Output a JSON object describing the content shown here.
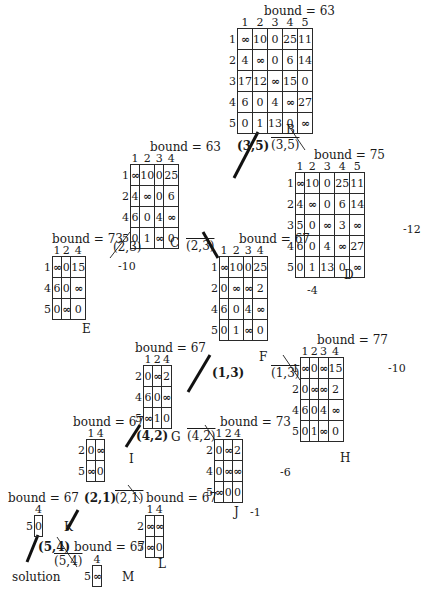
{
  "inf_symbol": "∞",
  "nodes": {
    "B": {
      "label": "B",
      "bound": "bound = 63",
      "cols": [
        "1",
        "2",
        "3",
        "4",
        "5"
      ],
      "rows": [
        "1",
        "2",
        "3",
        "4",
        "5"
      ],
      "cells": [
        [
          "∞",
          "10",
          "0",
          "25",
          "11"
        ],
        [
          "4",
          "∞",
          "0",
          "6",
          "14"
        ],
        [
          "17",
          "12",
          "∞",
          "15",
          "0"
        ],
        [
          "6",
          "0",
          "4",
          "∞",
          "27"
        ],
        [
          "0",
          "1",
          "13",
          "0",
          "∞"
        ]
      ],
      "reduction": ""
    },
    "C": {
      "label": "C",
      "bound": "bound = 63",
      "cols": [
        "1",
        "2",
        "3",
        "4"
      ],
      "rows": [
        "1",
        "2",
        "4",
        "5"
      ],
      "cells": [
        [
          "∞",
          "10",
          "0",
          "25"
        ],
        [
          "4",
          "∞",
          "0",
          "6"
        ],
        [
          "6",
          "0",
          "4",
          "∞"
        ],
        [
          "0",
          "1",
          "∞",
          "0"
        ]
      ],
      "reduction": ""
    },
    "D": {
      "label": "D",
      "bound": "bound = 75",
      "cols": [
        "1",
        "2",
        "3",
        "4",
        "5"
      ],
      "rows": [
        "1",
        "2",
        "3",
        "4",
        "5"
      ],
      "cells": [
        [
          "∞",
          "10",
          "0",
          "25",
          "11"
        ],
        [
          "4",
          "∞",
          "0",
          "6",
          "14"
        ],
        [
          "5",
          "0",
          "∞",
          "3",
          "∞"
        ],
        [
          "6",
          "0",
          "4",
          "∞",
          "27"
        ],
        [
          "0",
          "1",
          "13",
          "0",
          "∞"
        ]
      ],
      "reduction": "-12"
    },
    "E": {
      "label": "E",
      "bound": "bound = 73",
      "cols": [
        "1",
        "2",
        "4"
      ],
      "rows": [
        "1",
        "4",
        "5"
      ],
      "cells": [
        [
          "∞",
          "0",
          "15"
        ],
        [
          "6",
          "0",
          "∞"
        ],
        [
          "0",
          "∞",
          "0"
        ]
      ],
      "reduction": "-10"
    },
    "F": {
      "label": "F",
      "bound": "bound = 67",
      "cols": [
        "1",
        "2",
        "3",
        "4"
      ],
      "rows": [
        "1",
        "2",
        "4",
        "5"
      ],
      "cells": [
        [
          "∞",
          "10",
          "0",
          "25"
        ],
        [
          "0",
          "∞",
          "∞",
          "2"
        ],
        [
          "6",
          "0",
          "4",
          "∞"
        ],
        [
          "0",
          "1",
          "∞",
          "0"
        ]
      ],
      "reduction": "-4"
    },
    "G": {
      "label": "G",
      "bound": "bound = 67",
      "cols": [
        "1",
        "2",
        "4"
      ],
      "rows": [
        "2",
        "4",
        "5"
      ],
      "cells": [
        [
          "0",
          "∞",
          "2"
        ],
        [
          "6",
          "0",
          "∞"
        ],
        [
          "∞",
          "1",
          "0"
        ]
      ],
      "reduction": ""
    },
    "H": {
      "label": "H",
      "bound": "bound = 77",
      "cols": [
        "1",
        "2",
        "3",
        "4"
      ],
      "rows": [
        "1",
        "2",
        "4",
        "5"
      ],
      "cells": [
        [
          "∞",
          "0",
          "∞",
          "15"
        ],
        [
          "0",
          "∞",
          "∞",
          "2"
        ],
        [
          "6",
          "0",
          "4",
          "∞"
        ],
        [
          "0",
          "1",
          "∞",
          "0"
        ]
      ],
      "reduction": "-10"
    },
    "I": {
      "label": "I",
      "bound": "bound = 67",
      "cols": [
        "1",
        "4"
      ],
      "rows": [
        "2",
        "5"
      ],
      "cells": [
        [
          "0",
          "∞"
        ],
        [
          "∞",
          "0"
        ]
      ],
      "reduction": ""
    },
    "J": {
      "label": "J",
      "bound": "bound = 73",
      "cols": [
        "1",
        "2",
        "4"
      ],
      "rows": [
        "2",
        "4",
        "5"
      ],
      "cells": [
        [
          "0",
          "∞",
          "2"
        ],
        [
          "0",
          "∞",
          "∞"
        ],
        [
          "∞",
          "0",
          "0"
        ]
      ],
      "reduction": "-6",
      "col_reduction": "-1"
    },
    "K": {
      "label": "K",
      "bound": "bound = 67",
      "cols": [
        "4"
      ],
      "rows": [
        "5"
      ],
      "cells": [
        [
          "0"
        ]
      ],
      "reduction": ""
    },
    "L": {
      "label": "L",
      "bound": "bound = 67",
      "cols": [
        "1",
        "4"
      ],
      "rows": [
        "2",
        "5"
      ],
      "cells": [
        [
          "∞",
          "∞"
        ],
        [
          "∞",
          "0"
        ]
      ],
      "reduction": ""
    },
    "M": {
      "label": "M",
      "bound": "bound = 67",
      "cols": [
        "4"
      ],
      "rows": [
        "5"
      ],
      "cells": [
        [
          "∞"
        ]
      ],
      "reduction": ""
    }
  },
  "edges": [
    {
      "from": "B",
      "to": "C",
      "label": "(3,5)",
      "included": true
    },
    {
      "from": "B",
      "to": "D",
      "label": "(3,5)",
      "included": false
    },
    {
      "from": "C",
      "to": "E",
      "label": "(2,3)",
      "included": false
    },
    {
      "from": "C",
      "to": "F",
      "label": "(2,3)",
      "included": true
    },
    {
      "from": "F",
      "to": "G",
      "label": "(1,3)",
      "included": true
    },
    {
      "from": "F",
      "to": "H",
      "label": "(1,3)",
      "included": false
    },
    {
      "from": "G",
      "to": "I",
      "label": "(4,2)",
      "included": true
    },
    {
      "from": "G",
      "to": "J",
      "label": "(4,2)",
      "included": false
    },
    {
      "from": "I",
      "to": "K",
      "label": "(2,1)",
      "included": true
    },
    {
      "from": "I",
      "to": "L",
      "label": "(2,1)",
      "included": false
    },
    {
      "from": "K",
      "to": "solution",
      "label": "(5,4)",
      "included": true
    },
    {
      "from": "K",
      "to": "M",
      "label": "(5,4)",
      "included": false
    }
  ],
  "solution_label": "solution"
}
